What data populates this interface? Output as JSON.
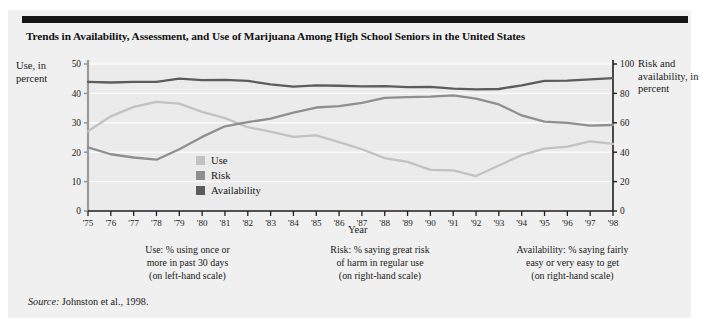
{
  "figure": {
    "title": "Trends in Availability, Assessment, and Use of Marijuana Among High School Seniors in the United States",
    "source_word": "Source:",
    "source_text": " Johnston et al., 1998."
  },
  "axis": {
    "left_label": "Use, in percent",
    "right_label": "Risk and availability, in percent",
    "x_title": "Year"
  },
  "legend": {
    "items": [
      {
        "label": "Use",
        "color": "#c2c2c2"
      },
      {
        "label": "Risk",
        "color": "#8f8f8f"
      },
      {
        "label": "Availability",
        "color": "#5c5c5c"
      }
    ]
  },
  "captions": [
    "Use: % using once or more in past 30 days (on left-hand scale)",
    "Risk: % saying great risk of harm in regular use (on right-hand scale)",
    "Availability: % saying fairly easy or very easy to get (on right-hand scale)"
  ],
  "caption_lines": [
    [
      "Use: % using once or",
      "more in past 30 days",
      "(on left-hand scale)"
    ],
    [
      "Risk: % saying great risk",
      "of harm in regular use",
      "(on right-hand scale)"
    ],
    [
      "Availability: % saying fairly",
      "easy or very easy to get",
      "(on right-hand scale)"
    ]
  ],
  "chart_data": {
    "type": "line",
    "title": "Trends in Availability, Assessment, and Use of Marijuana Among High School Seniors in the United States",
    "xlabel": "Year",
    "ylabel": "Use, in percent",
    "y2label": "Risk and availability, in percent",
    "ylim": [
      0,
      50
    ],
    "y2lim": [
      0,
      100
    ],
    "yticks": [
      0,
      10,
      20,
      30,
      40,
      50
    ],
    "y2ticks": [
      0,
      20,
      40,
      60,
      80,
      100
    ],
    "grid": true,
    "legend_position": "inside-center-left",
    "categories": [
      "'75",
      "'76",
      "'77",
      "'78",
      "'79",
      "'80",
      "'81",
      "'82",
      "'83",
      "'84",
      "'85",
      "'86",
      "'87",
      "'88",
      "'89",
      "'90",
      "'91",
      "'92",
      "'93",
      "'94",
      "'95",
      "'96",
      "'97",
      "'98"
    ],
    "x": [
      1975,
      1976,
      1977,
      1978,
      1979,
      1980,
      1981,
      1982,
      1983,
      1984,
      1985,
      1986,
      1987,
      1988,
      1989,
      1990,
      1991,
      1992,
      1993,
      1994,
      1995,
      1996,
      1997,
      1998
    ],
    "series": [
      {
        "name": "Use",
        "axis": "left",
        "color": "#c2c2c2",
        "values": [
          27.1,
          32.2,
          35.4,
          37.1,
          36.5,
          33.7,
          31.6,
          28.5,
          27.0,
          25.2,
          25.7,
          23.4,
          21.0,
          18.0,
          16.7,
          14.0,
          13.8,
          11.9,
          15.5,
          19.0,
          21.2,
          21.9,
          23.7,
          22.8
        ]
      },
      {
        "name": "Risk",
        "axis": "right",
        "color": "#8f8f8f",
        "values": [
          43.3,
          38.6,
          36.4,
          34.9,
          42.0,
          50.4,
          57.6,
          60.4,
          62.8,
          66.9,
          70.4,
          71.3,
          73.5,
          77.0,
          77.5,
          77.8,
          78.6,
          76.5,
          72.5,
          65.0,
          60.8,
          59.9,
          58.1,
          58.5
        ]
      },
      {
        "name": "Availability",
        "axis": "right",
        "color": "#5c5c5c",
        "values": [
          87.8,
          87.4,
          87.9,
          87.8,
          90.1,
          89.0,
          89.2,
          88.5,
          86.2,
          84.6,
          85.5,
          85.2,
          84.8,
          85.0,
          84.3,
          84.4,
          83.3,
          82.7,
          83.0,
          85.5,
          88.5,
          88.7,
          89.6,
          90.4
        ]
      }
    ]
  }
}
